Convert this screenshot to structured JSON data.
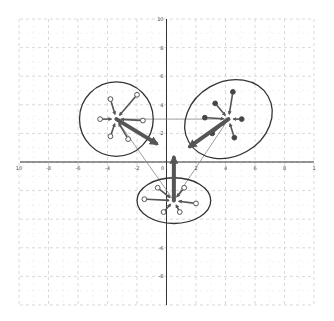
{
  "diagram": {
    "title": "",
    "type": "cluster-vector-diagram",
    "colors": {
      "background": "#ffffff",
      "grid": "#c8c8c8",
      "axis": "#333333",
      "ellipse": "#333333",
      "centroid_arrow": "#555555",
      "point_arrow": "#555555",
      "connector": "#888888",
      "hollow_point_fill": "#ffffff",
      "filled_point_fill": "#444444"
    },
    "axes": {
      "x_range": [
        -10,
        10
      ],
      "y_range": [
        -10,
        10
      ],
      "x_ticks": [
        {
          "value": -10,
          "label": "10"
        },
        {
          "value": -8,
          "label": "-8"
        },
        {
          "value": -6,
          "label": "-6"
        },
        {
          "value": -4,
          "label": "-4"
        },
        {
          "value": -2,
          "label": "-2"
        },
        {
          "value": 0,
          "label": "0"
        },
        {
          "value": 2,
          "label": "2"
        },
        {
          "value": 4,
          "label": "4"
        },
        {
          "value": 6,
          "label": "6"
        },
        {
          "value": 8,
          "label": "8"
        },
        {
          "value": 10,
          "label": "1"
        }
      ],
      "y_ticks": [
        {
          "value": 10,
          "label": "10"
        },
        {
          "value": 8,
          "label": "8"
        },
        {
          "value": 6,
          "label": "6"
        },
        {
          "value": 4,
          "label": "4"
        },
        {
          "value": 2,
          "label": "2"
        },
        {
          "value": -6,
          "label": "-6"
        },
        {
          "value": -8,
          "label": "-8"
        }
      ]
    },
    "clusters": [
      {
        "name": "left-cluster",
        "center": [
          -3.4,
          3.0
        ],
        "ellipse": {
          "rx": 2.5,
          "ry": 2.6,
          "rotation": 0
        },
        "point_style": "hollow",
        "points": [
          [
            -3.8,
            4.4
          ],
          [
            -2.0,
            4.7
          ],
          [
            -4.5,
            3.0
          ],
          [
            -1.6,
            2.9
          ],
          [
            -3.8,
            1.8
          ],
          [
            -2.6,
            1.6
          ]
        ],
        "centroid_arrow_to": [
          -0.7,
          1.3
        ]
      },
      {
        "name": "right-cluster",
        "center": [
          4.2,
          3.0
        ],
        "ellipse": {
          "rx": 3.1,
          "ry": 2.6,
          "rotation": -30
        },
        "point_style": "filled",
        "points": [
          [
            3.3,
            4.1
          ],
          [
            4.5,
            4.9
          ],
          [
            2.6,
            3.1
          ],
          [
            5.1,
            3.0
          ],
          [
            3.1,
            2.0
          ],
          [
            4.6,
            1.7
          ]
        ],
        "centroid_arrow_to": [
          1.6,
          1.1
        ]
      },
      {
        "name": "bottom-cluster",
        "center": [
          0.5,
          -2.7
        ],
        "ellipse": {
          "rx": 2.5,
          "ry": 1.6,
          "rotation": 0
        },
        "point_style": "hollow",
        "points": [
          [
            -0.6,
            -1.8
          ],
          [
            1.2,
            -1.8
          ],
          [
            -1.5,
            -2.6
          ],
          [
            2.0,
            -2.9
          ],
          [
            -0.2,
            -3.5
          ],
          [
            0.9,
            -3.5
          ]
        ],
        "centroid_arrow_to": [
          0.5,
          0.3
        ]
      }
    ],
    "connectors": [
      {
        "from": "left-cluster",
        "to": "right-cluster"
      },
      {
        "from": "left-cluster",
        "to": "bottom-cluster"
      },
      {
        "from": "right-cluster",
        "to": "bottom-cluster"
      }
    ]
  }
}
